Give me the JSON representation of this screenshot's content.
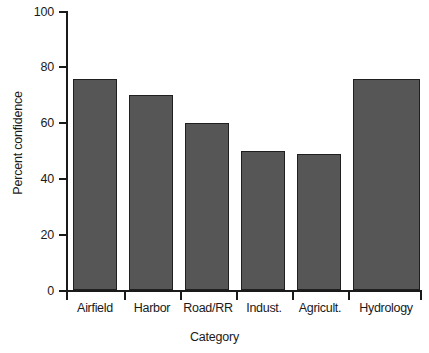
{
  "chart_data": {
    "type": "bar",
    "title": "",
    "subtitle": "",
    "xlabel": "Category",
    "ylabel": "Percent confidence",
    "categories": [
      "Airfield",
      "Harbor",
      "Road/RR",
      "Indust.",
      "Agricult.",
      "Hydrology"
    ],
    "values": [
      76,
      70,
      60,
      50,
      49,
      76
    ],
    "series": [
      {
        "name": "Percent confidence",
        "values": [
          76,
          70,
          60,
          50,
          49,
          76
        ]
      }
    ],
    "ylim": [
      0,
      100
    ],
    "yticks": [
      0,
      20,
      40,
      60,
      80,
      100
    ],
    "ytick_labels": [
      "0",
      "20",
      "40",
      "60",
      "80",
      "100"
    ],
    "grid": false,
    "legend": false,
    "legend_position": "none",
    "bar_color": "#565656",
    "bar_edge_color": "#1f1f1f",
    "axis_color": "#1a1a1a",
    "background_color": "#ffffff",
    "annotations": []
  }
}
